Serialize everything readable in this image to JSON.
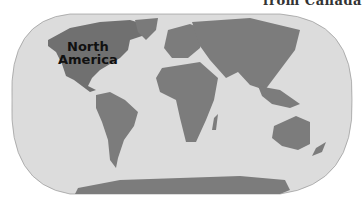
{
  "header": {
    "clipped_caption": "from Canada"
  },
  "map": {
    "projection": "world-robinson-style",
    "ocean_color": "#dcdcdc",
    "land_color": "#808080",
    "highlight_color": "#6e6e6e",
    "labels": [
      {
        "line1": "North",
        "line2": "America"
      }
    ]
  }
}
